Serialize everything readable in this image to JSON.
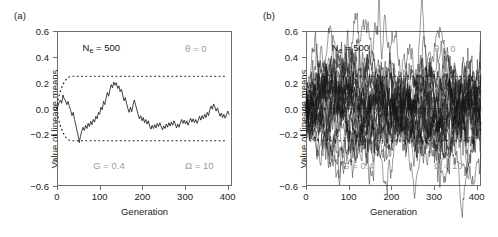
{
  "figure": {
    "panels": [
      {
        "label": "(a)",
        "xlabel": "Generation",
        "ylabel": "Value of lineage means",
        "annotations": {
          "ne": "Nₑ = 500",
          "theta": "θ = 0",
          "g": "G = 0.4",
          "omega": "Ω = 10"
        }
      },
      {
        "label": "(b)",
        "xlabel": "Generation",
        "ylabel": "Value of lineage means",
        "annotations": {
          "ne": "Nₑ = 500",
          "theta": "θ = 0",
          "g": "G = 0.4",
          "omega": "Ω = 10"
        }
      }
    ]
  },
  "chart_data": [
    {
      "type": "line",
      "title": "(a)",
      "xlabel": "Generation",
      "ylabel": "Value of lineage means",
      "xlim": [
        0,
        410
      ],
      "ylim": [
        -0.6,
        0.6
      ],
      "xticks": [
        0,
        100,
        200,
        300,
        400
      ],
      "xtick_labels": [
        "0",
        "100",
        "200",
        "300",
        "400"
      ],
      "yticks": [
        0.6,
        0.4,
        0.2,
        0.0,
        -0.2,
        -0.4,
        -0.6
      ],
      "ytick_labels": [
        "0.6",
        "0.4",
        "0.2",
        "0.0",
        "-0.2",
        "",
        "-0.6"
      ],
      "grid": false,
      "legend": null,
      "annotations": [
        {
          "text": "Nₑ = 500",
          "x": 60,
          "y": 0.47,
          "color": "#141414"
        },
        {
          "text": "θ = 0",
          "x": 300,
          "y": 0.47,
          "color": "#9a9a9a"
        },
        {
          "text": "G = 0.4",
          "x": 85,
          "y": -0.44,
          "color": "#9a9a9a"
        },
        {
          "text": "Ω = 10",
          "x": 300,
          "y": -0.44,
          "color": "#9a9a9a"
        }
      ],
      "envelope": {
        "style": "dotted",
        "color": "#1a1a1a",
        "plateau": 0.25,
        "description": "Expanding dotted envelope from 0 saturating at ±0.25 by generation ~28",
        "upper": [
          [
            0,
            0.0
          ],
          [
            3,
            0.075
          ],
          [
            6,
            0.115
          ],
          [
            9,
            0.145
          ],
          [
            12,
            0.17
          ],
          [
            15,
            0.192
          ],
          [
            18,
            0.21
          ],
          [
            21,
            0.224
          ],
          [
            24,
            0.235
          ],
          [
            28,
            0.244
          ],
          [
            32,
            0.248
          ],
          [
            40,
            0.25
          ],
          [
            400,
            0.25
          ]
        ],
        "lower": [
          [
            0,
            0.0
          ],
          [
            3,
            -0.075
          ],
          [
            6,
            -0.115
          ],
          [
            9,
            -0.145
          ],
          [
            12,
            -0.17
          ],
          [
            15,
            -0.192
          ],
          [
            18,
            -0.21
          ],
          [
            21,
            -0.224
          ],
          [
            24,
            -0.235
          ],
          [
            28,
            -0.244
          ],
          [
            32,
            -0.248
          ],
          [
            40,
            -0.25
          ],
          [
            400,
            -0.25
          ]
        ]
      },
      "series": [
        {
          "name": "lineage mean trajectory",
          "color": "#111111",
          "values": [
            [
              0,
              0.0
            ],
            [
              4,
              0.04
            ],
            [
              8,
              0.065
            ],
            [
              11,
              0.04
            ],
            [
              14,
              0.105
            ],
            [
              17,
              0.075
            ],
            [
              20,
              0.06
            ],
            [
              23,
              0.03
            ],
            [
              26,
              0.055
            ],
            [
              29,
              0.015
            ],
            [
              32,
              -0.015
            ],
            [
              35,
              -0.055
            ],
            [
              38,
              -0.03
            ],
            [
              41,
              -0.085
            ],
            [
              44,
              -0.125
            ],
            [
              47,
              -0.175
            ],
            [
              50,
              -0.215
            ],
            [
              52,
              -0.265
            ],
            [
              55,
              -0.215
            ],
            [
              58,
              -0.175
            ],
            [
              61,
              -0.145
            ],
            [
              64,
              -0.17
            ],
            [
              67,
              -0.13
            ],
            [
              70,
              -0.155
            ],
            [
              73,
              -0.115
            ],
            [
              76,
              -0.14
            ],
            [
              79,
              -0.1
            ],
            [
              82,
              -0.125
            ],
            [
              85,
              -0.085
            ],
            [
              88,
              -0.105
            ],
            [
              91,
              -0.06
            ],
            [
              94,
              -0.08
            ],
            [
              97,
              -0.03
            ],
            [
              100,
              -0.045
            ],
            [
              103,
              0.01
            ],
            [
              106,
              -0.01
            ],
            [
              109,
              0.055
            ],
            [
              112,
              0.03
            ],
            [
              115,
              0.08
            ],
            [
              118,
              0.125
            ],
            [
              121,
              0.095
            ],
            [
              124,
              0.145
            ],
            [
              127,
              0.185
            ],
            [
              130,
              0.16
            ],
            [
              133,
              0.205
            ],
            [
              136,
              0.18
            ],
            [
              139,
              0.2
            ],
            [
              142,
              0.155
            ],
            [
              145,
              0.175
            ],
            [
              148,
              0.13
            ],
            [
              151,
              0.15
            ],
            [
              154,
              0.105
            ],
            [
              157,
              0.06
            ],
            [
              160,
              0.085
            ],
            [
              163,
              0.04
            ],
            [
              166,
              0.0
            ],
            [
              169,
              -0.03
            ],
            [
              172,
              0.01
            ],
            [
              175,
              -0.025
            ],
            [
              178,
              0.025
            ],
            [
              181,
              0.065
            ],
            [
              184,
              0.03
            ],
            [
              187,
              -0.01
            ],
            [
              190,
              -0.045
            ],
            [
              193,
              -0.08
            ],
            [
              196,
              -0.055
            ],
            [
              199,
              -0.095
            ],
            [
              202,
              -0.07
            ],
            [
              205,
              -0.11
            ],
            [
              208,
              -0.085
            ],
            [
              211,
              -0.12
            ],
            [
              214,
              -0.095
            ],
            [
              217,
              -0.135
            ],
            [
              220,
              -0.16
            ],
            [
              223,
              -0.13
            ],
            [
              226,
              -0.155
            ],
            [
              229,
              -0.125
            ],
            [
              232,
              -0.15
            ],
            [
              235,
              -0.115
            ],
            [
              238,
              -0.14
            ],
            [
              241,
              -0.11
            ],
            [
              244,
              -0.14
            ],
            [
              247,
              -0.165
            ],
            [
              250,
              -0.135
            ],
            [
              253,
              -0.155
            ],
            [
              256,
              -0.12
            ],
            [
              259,
              -0.145
            ],
            [
              262,
              -0.11
            ],
            [
              265,
              -0.135
            ],
            [
              268,
              -0.105
            ],
            [
              271,
              -0.13
            ],
            [
              274,
              -0.095
            ],
            [
              277,
              -0.12
            ],
            [
              280,
              -0.15
            ],
            [
              283,
              -0.12
            ],
            [
              286,
              -0.145
            ],
            [
              289,
              -0.11
            ],
            [
              292,
              -0.085
            ],
            [
              295,
              -0.115
            ],
            [
              298,
              -0.09
            ],
            [
              301,
              -0.12
            ],
            [
              304,
              -0.095
            ],
            [
              307,
              -0.13
            ],
            [
              310,
              -0.1
            ],
            [
              313,
              -0.075
            ],
            [
              316,
              -0.105
            ],
            [
              319,
              -0.08
            ],
            [
              322,
              -0.11
            ],
            [
              325,
              -0.085
            ],
            [
              328,
              -0.115
            ],
            [
              331,
              -0.09
            ],
            [
              334,
              -0.06
            ],
            [
              337,
              -0.09
            ],
            [
              340,
              -0.055
            ],
            [
              343,
              -0.08
            ],
            [
              346,
              -0.045
            ],
            [
              349,
              -0.07
            ],
            [
              352,
              -0.03
            ],
            [
              355,
              -0.055
            ],
            [
              358,
              -0.01
            ],
            [
              361,
              0.02
            ],
            [
              364,
              -0.005
            ],
            [
              367,
              0.035
            ],
            [
              370,
              0.01
            ],
            [
              373,
              -0.02
            ],
            [
              376,
              0.005
            ],
            [
              379,
              -0.03
            ],
            [
              382,
              -0.06
            ],
            [
              385,
              -0.035
            ],
            [
              388,
              -0.07
            ],
            [
              391,
              -0.045
            ],
            [
              394,
              -0.075
            ],
            [
              397,
              -0.05
            ],
            [
              400,
              -0.02
            ],
            [
              403,
              -0.045
            ]
          ]
        }
      ]
    },
    {
      "type": "line",
      "title": "(b)",
      "xlabel": "Generation",
      "ylabel": "Value of lineage means",
      "xlim": [
        0,
        410
      ],
      "ylim": [
        -0.6,
        0.6
      ],
      "xticks": [
        0,
        100,
        200,
        300,
        400
      ],
      "xtick_labels": [
        "0",
        "100",
        "200",
        "300",
        "400"
      ],
      "yticks": [
        0.6,
        0.4,
        0.2,
        0.0,
        -0.2,
        -0.4,
        -0.6
      ],
      "ytick_labels": [
        "0.6",
        "0.4",
        "0.2",
        "0.0",
        "-0.2",
        "",
        "-0.6"
      ],
      "grid": false,
      "legend": null,
      "annotations": [
        {
          "text": "Nₑ = 500",
          "x": 60,
          "y": 0.47,
          "color": "#141414"
        },
        {
          "text": "θ = 0",
          "x": 300,
          "y": 0.47,
          "color": "#9a9a9a"
        },
        {
          "text": "G = 0.4",
          "x": 85,
          "y": -0.44,
          "color": "#9a9a9a"
        },
        {
          "text": "Ω = 10",
          "x": 300,
          "y": -0.44,
          "color": "#9a9a9a"
        }
      ],
      "envelope": {
        "style": "dotted",
        "color": "#1a1a1a",
        "plateau": 0.25,
        "description": "Expanding dotted envelope from 0 saturating at ±0.25 by generation ~28",
        "upper": [
          [
            0,
            0.0
          ],
          [
            3,
            0.075
          ],
          [
            6,
            0.115
          ],
          [
            9,
            0.145
          ],
          [
            12,
            0.17
          ],
          [
            15,
            0.192
          ],
          [
            18,
            0.21
          ],
          [
            21,
            0.224
          ],
          [
            24,
            0.235
          ],
          [
            28,
            0.244
          ],
          [
            32,
            0.248
          ],
          [
            40,
            0.25
          ],
          [
            400,
            0.25
          ]
        ],
        "lower": [
          [
            0,
            0.0
          ],
          [
            3,
            -0.075
          ],
          [
            6,
            -0.115
          ],
          [
            9,
            -0.145
          ],
          [
            12,
            -0.17
          ],
          [
            15,
            -0.192
          ],
          [
            18,
            -0.21
          ],
          [
            21,
            -0.224
          ],
          [
            24,
            -0.235
          ],
          [
            28,
            -0.244
          ],
          [
            32,
            -0.248
          ],
          [
            40,
            -0.25
          ],
          [
            400,
            -0.25
          ]
        ]
      },
      "n_replicates": 28,
      "band": {
        "description": "Dense overlapping band of 28 independent lineage trajectories, stationary about 0, bulk spread roughly ±0.22, excursions to about ±0.30",
        "center": 0.0,
        "typical_spread": 0.22,
        "max_excursion_up": 0.35,
        "max_excursion_down": -0.33,
        "notable_features": [
          {
            "type": "upward spike",
            "x": 46,
            "y": 0.35
          },
          {
            "type": "downward spike",
            "x": 105,
            "y": -0.33
          }
        ]
      }
    }
  ]
}
